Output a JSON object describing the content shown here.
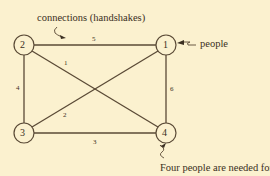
{
  "annotations": {
    "title": "connections (handshakes)",
    "people_label": "people",
    "footer": "Four people are needed for"
  },
  "nodes": [
    {
      "id": "1",
      "label": "1",
      "x": 166,
      "y": 45
    },
    {
      "id": "2",
      "label": "2",
      "x": 24,
      "y": 45
    },
    {
      "id": "3",
      "label": "3",
      "x": 24,
      "y": 133
    },
    {
      "id": "4",
      "label": "4",
      "x": 166,
      "y": 133
    }
  ],
  "edges": [
    {
      "from": "2",
      "to": "4",
      "label": "1"
    },
    {
      "from": "3",
      "to": "1",
      "label": "2"
    },
    {
      "from": "3",
      "to": "4",
      "label": "3"
    },
    {
      "from": "2",
      "to": "3",
      "label": "4"
    },
    {
      "from": "2",
      "to": "1",
      "label": "5"
    },
    {
      "from": "1",
      "to": "4",
      "label": "6"
    }
  ],
  "colors": {
    "background": "#fbf1cf",
    "ink": "#3a2f22",
    "line": "#5a4a36"
  }
}
